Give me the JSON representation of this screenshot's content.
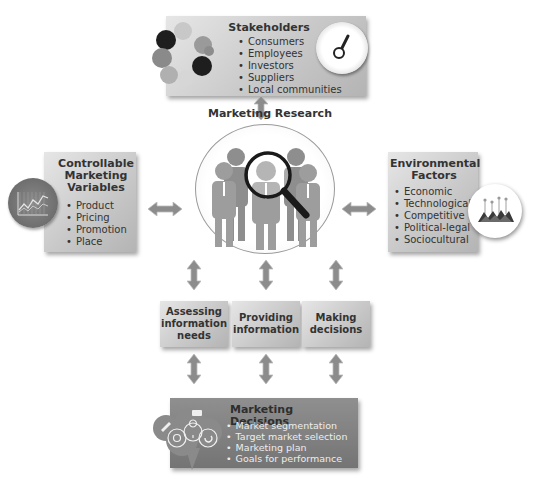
{
  "stakeholders": {
    "title": "Stakeholders",
    "items": [
      "Consumers",
      "Employees",
      "Investors",
      "Suppliers",
      "Local communities"
    ],
    "icons": [
      "people-cluster-icon",
      "gauge-icon"
    ]
  },
  "controllable": {
    "title_lines": [
      "Controllable",
      "Marketing",
      "Variables"
    ],
    "items": [
      "Product",
      "Pricing",
      "Promotion",
      "Place"
    ],
    "icon": "line-chart-icon"
  },
  "environmental": {
    "title_lines": [
      "Environmental",
      "Factors"
    ],
    "items": [
      "Economic",
      "Technological",
      "Competitive",
      "Political-legal",
      "Sociocultural"
    ],
    "icon": "mountain-chart-icon"
  },
  "center": {
    "title": "Marketing Research",
    "icon": "people-magnifier-icon"
  },
  "middle": [
    {
      "lines": [
        "Assessing",
        "information",
        "needs"
      ]
    },
    {
      "lines": [
        "Providing",
        "information"
      ]
    },
    {
      "lines": [
        "Making",
        "decisions"
      ]
    }
  ],
  "decisions": {
    "title": "Marketing Decisions",
    "items": [
      "Market segmentation",
      "Target market selection",
      "Marketing plan",
      "Goals for performance"
    ],
    "icon": "speech-cloud-icons"
  },
  "colors": {
    "box_light": "#d0d0d0",
    "box_dark": "#7f7f7f",
    "arrow": "#8c8c8c",
    "text": "#333333"
  }
}
